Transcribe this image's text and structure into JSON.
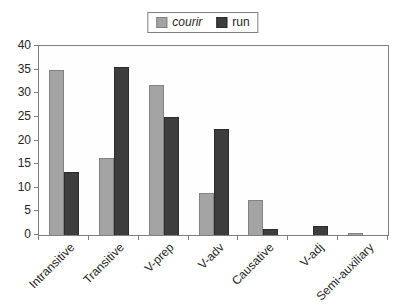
{
  "chart_data": {
    "type": "bar",
    "title": "",
    "xlabel": "",
    "ylabel": "",
    "categories": [
      "Intransitive",
      "Transitive",
      "V-prep",
      "V-adv",
      "Causative",
      "V-adj",
      "Semi-auxiliary"
    ],
    "series": [
      {
        "name": "courir",
        "italic": true,
        "color": "#a4a4a4",
        "border_color": "#828282",
        "values": [
          35,
          16.3,
          31.8,
          8.8,
          7.4,
          0,
          0.5
        ]
      },
      {
        "name": "run",
        "italic": false,
        "color": "#3d3d3d",
        "border_color": "#2b2b2b",
        "values": [
          13.4,
          35.5,
          25,
          22.5,
          1.2,
          2,
          0
        ]
      }
    ],
    "ylim": [
      0,
      40
    ],
    "ytick_step": 5,
    "yticks": [
      "0",
      "5",
      "10",
      "15",
      "20",
      "25",
      "30",
      "35",
      "40"
    ],
    "grid": false,
    "legend_position": "top-center",
    "axis_color": "#7f7f7f",
    "text_color": "#262626"
  }
}
